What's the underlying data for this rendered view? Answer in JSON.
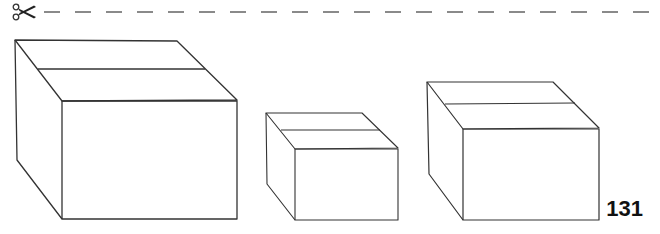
{
  "cut_line": {
    "icon": "scissors-icon",
    "style": "dashed",
    "color": "#8a8a8a"
  },
  "illustration": {
    "description": "Three line-drawn cardboard boxes in perspective",
    "stroke_color": "#333333",
    "boxes": [
      {
        "name": "large-box",
        "size": "large"
      },
      {
        "name": "small-box",
        "size": "small"
      },
      {
        "name": "medium-box",
        "size": "medium"
      }
    ]
  },
  "page": {
    "number": "131"
  }
}
